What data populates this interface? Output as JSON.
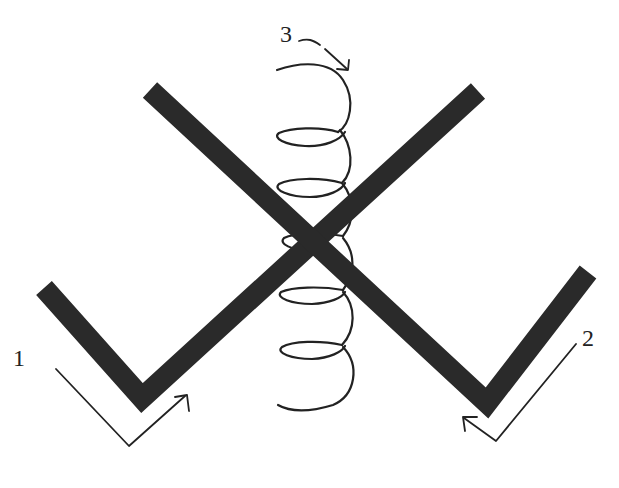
{
  "diagram": {
    "labels": {
      "label_1": "1",
      "label_2": "2",
      "label_3": "3"
    },
    "colors": {
      "bar": "#2a2a2a",
      "spring": "#222222",
      "arrow": "#222222",
      "background": "#ffffff"
    },
    "parts": [
      {
        "id": "1",
        "name": "V-bar 1 (left vertex)",
        "motion": "rotation arrow pointing up-right"
      },
      {
        "id": "2",
        "name": "V-bar 2 (right vertex)",
        "motion": "rotation arrow pointing up-left"
      },
      {
        "id": "3",
        "name": "helical spring",
        "motion": "curved arrow pointing down-right"
      }
    ]
  }
}
